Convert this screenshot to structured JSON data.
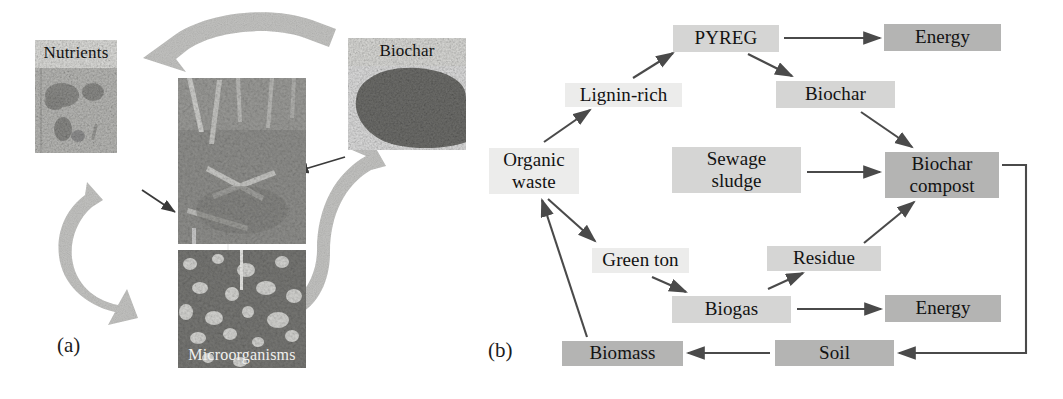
{
  "figure": {
    "panels": [
      {
        "id": "a",
        "label": "(a)"
      },
      {
        "id": "b",
        "label": "(b)"
      }
    ]
  },
  "panel_a": {
    "label": "(a)",
    "photos": [
      {
        "name": "nutrients",
        "caption": "Nutrients",
        "caption_position": "top"
      },
      {
        "name": "soil-litter",
        "caption": "",
        "caption_position": "none"
      },
      {
        "name": "biochar",
        "caption": "Biochar",
        "caption_position": "top"
      },
      {
        "name": "microorganisms",
        "caption": "Microorganisms",
        "caption_position": "bottom"
      }
    ],
    "cycle_arrows": [
      {
        "from": "Biochar",
        "to": "Nutrients",
        "style": "ribbon"
      },
      {
        "from": "Nutrients",
        "to": "Microorganisms",
        "style": "ribbon"
      },
      {
        "from": "Microorganisms",
        "to": "Biochar",
        "style": "ribbon"
      }
    ],
    "thin_arrows": [
      {
        "from": "Biochar",
        "to": "soil-litter"
      },
      {
        "from": "Nutrients",
        "to": "soil-litter"
      },
      {
        "from": "soil-litter",
        "to": "Microorganisms"
      }
    ]
  },
  "panel_b": {
    "label": "(b)",
    "nodes": [
      {
        "id": "pyreg",
        "label": "PYREG",
        "shade": "mid",
        "x": 203,
        "y": 25,
        "w": 106,
        "h": 27
      },
      {
        "id": "energy-top",
        "label": "Energy",
        "shade": "dark",
        "x": 414,
        "y": 24,
        "w": 117,
        "h": 27
      },
      {
        "id": "lignin-rich",
        "label": "Lignin-rich",
        "shade": "light",
        "x": 95,
        "y": 83,
        "w": 117,
        "h": 24
      },
      {
        "id": "biochar",
        "label": "Biochar",
        "shade": "mid",
        "x": 306,
        "y": 81,
        "w": 119,
        "h": 27
      },
      {
        "id": "organic-waste",
        "label": "Organic\nwaste",
        "shade": "light",
        "x": 19,
        "y": 148,
        "w": 90,
        "h": 46
      },
      {
        "id": "sewage-sludge",
        "label": "Sewage\nsludge",
        "shade": "mid",
        "x": 202,
        "y": 147,
        "w": 129,
        "h": 46
      },
      {
        "id": "biochar-compost",
        "label": "Biochar\ncompost",
        "shade": "dark",
        "x": 415,
        "y": 152,
        "w": 114,
        "h": 46
      },
      {
        "id": "green-ton",
        "label": "Green ton",
        "shade": "light",
        "x": 122,
        "y": 248,
        "w": 97,
        "h": 25
      },
      {
        "id": "residue",
        "label": "Residue",
        "shade": "mid",
        "x": 297,
        "y": 246,
        "w": 114,
        "h": 25
      },
      {
        "id": "biogas",
        "label": "Biogas",
        "shade": "mid",
        "x": 202,
        "y": 296,
        "w": 119,
        "h": 27
      },
      {
        "id": "energy-bottom",
        "label": "Energy",
        "shade": "dark",
        "x": 415,
        "y": 295,
        "w": 116,
        "h": 27
      },
      {
        "id": "biomass",
        "label": "Biomass",
        "shade": "dark",
        "x": 92,
        "y": 341,
        "w": 121,
        "h": 25
      },
      {
        "id": "soil",
        "label": "Soil",
        "shade": "dark",
        "x": 305,
        "y": 340,
        "w": 119,
        "h": 26
      }
    ],
    "edges": [
      {
        "from": "organic-waste",
        "to": "lignin-rich",
        "type": "arrow"
      },
      {
        "from": "lignin-rich",
        "to": "pyreg",
        "type": "arrow"
      },
      {
        "from": "pyreg",
        "to": "energy-top",
        "type": "arrow"
      },
      {
        "from": "pyreg",
        "to": "biochar",
        "type": "arrow"
      },
      {
        "from": "biochar",
        "to": "biochar-compost",
        "type": "arrow"
      },
      {
        "from": "sewage-sludge",
        "to": "biochar-compost",
        "type": "arrow"
      },
      {
        "from": "organic-waste",
        "to": "green-ton",
        "type": "arrow"
      },
      {
        "from": "green-ton",
        "to": "biogas",
        "type": "arrow"
      },
      {
        "from": "biogas",
        "to": "residue",
        "type": "arrow"
      },
      {
        "from": "biogas",
        "to": "energy-bottom",
        "type": "arrow"
      },
      {
        "from": "residue",
        "to": "biochar-compost",
        "type": "arrow"
      },
      {
        "from": "biochar-compost",
        "to": "soil",
        "type": "elbow-arrow"
      },
      {
        "from": "soil",
        "to": "biomass",
        "type": "arrow"
      },
      {
        "from": "biomass",
        "to": "organic-waste",
        "type": "arrow"
      }
    ],
    "colors": {
      "shade_light": "#ececeb",
      "shade_mid": "#d5d5d4",
      "shade_dark": "#b4b4b3",
      "line": "#4a4a4a",
      "text": "#121212"
    }
  }
}
